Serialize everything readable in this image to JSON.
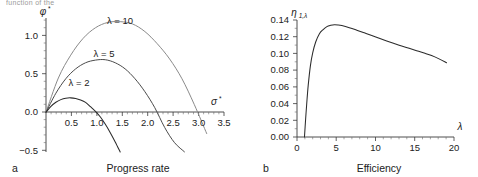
{
  "figure": {
    "top_cropped_text": "function of the",
    "panels": [
      {
        "letter": "a",
        "caption": "Progress rate"
      },
      {
        "letter": "b",
        "caption": "Efficiency"
      }
    ]
  },
  "chart_data": [
    {
      "type": "line",
      "panel": "a",
      "title": "Progress rate",
      "xlabel": "σ*",
      "ylabel": "φ*",
      "xlabel_base": "σ",
      "xlabel_sup": "*",
      "ylabel_base": "φ",
      "ylabel_sup": "*",
      "xlim": [
        0,
        3.6
      ],
      "ylim": [
        -0.55,
        1.3
      ],
      "grid": false,
      "legend": "inline-curve-labels",
      "xticks": [
        0.5,
        1.0,
        1.5,
        2.0,
        2.5,
        3.0,
        3.5
      ],
      "xtick_labels": [
        "0.5",
        "1.0",
        "1.5",
        "2.0",
        "2.5",
        "3.0",
        "3.5"
      ],
      "xticks_minor": [
        0.1,
        0.2,
        0.3,
        0.4,
        0.6,
        0.7,
        0.8,
        0.9,
        1.1,
        1.2,
        1.3,
        1.4,
        1.6,
        1.7,
        1.8,
        1.9,
        2.1,
        2.2,
        2.3,
        2.4,
        2.6,
        2.7,
        2.8,
        2.9,
        3.1,
        3.2,
        3.3,
        3.4
      ],
      "yticks": [
        -0.5,
        0.0,
        0.5,
        1.0
      ],
      "ytick_labels": [
        "−0.5",
        "0.0",
        "0.5",
        "1.0"
      ],
      "yticks_minor": [
        -0.4,
        -0.3,
        -0.2,
        -0.1,
        0.1,
        0.2,
        0.3,
        0.4,
        0.6,
        0.7,
        0.8,
        0.9,
        1.1,
        1.2
      ],
      "series": [
        {
          "name": "λ = 2",
          "label": "λ = 2",
          "color": "#2b2b2b",
          "peak_x": 0.55,
          "peak_y": 0.19,
          "zero_crossing_x": 1.1,
          "label_x": 0.72,
          "label_y": 0.34,
          "x": [
            0.0,
            0.1,
            0.2,
            0.3,
            0.4,
            0.5,
            0.6,
            0.7,
            0.8,
            0.9,
            1.0,
            1.1,
            1.2,
            1.3,
            1.4,
            1.5,
            1.6
          ],
          "values": [
            0.0,
            0.078,
            0.131,
            0.166,
            0.185,
            0.189,
            0.181,
            0.161,
            0.129,
            0.073,
            0.012,
            -0.062,
            -0.158,
            -0.268,
            -0.39,
            -0.522,
            -0.58
          ]
        },
        {
          "name": "λ = 5",
          "label": "λ = 5",
          "color": "#4a4a4a",
          "peak_x": 1.2,
          "peak_y": 0.69,
          "zero_crossing_x": 2.35,
          "label_x": 1.42,
          "label_y": 0.86,
          "x": [
            0.0,
            0.2,
            0.4,
            0.6,
            0.8,
            1.0,
            1.2,
            1.4,
            1.6,
            1.8,
            2.0,
            2.2,
            2.4,
            2.6,
            2.8,
            3.0
          ],
          "values": [
            0.0,
            0.25,
            0.44,
            0.57,
            0.65,
            0.685,
            0.69,
            0.65,
            0.57,
            0.44,
            0.27,
            0.06,
            -0.2,
            -0.4,
            -0.52,
            -0.58
          ]
        },
        {
          "name": "λ = 10",
          "label": "λ = 10",
          "color": "#8a8a8a",
          "peak_x": 1.55,
          "peak_y": 1.19,
          "zero_crossing_x": 3.1,
          "label_x": 1.62,
          "label_y": 1.38,
          "x": [
            0.0,
            0.25,
            0.5,
            0.75,
            1.0,
            1.25,
            1.5,
            1.75,
            2.0,
            2.25,
            2.5,
            2.75,
            3.0,
            3.25,
            3.5
          ],
          "values": [
            0.0,
            0.45,
            0.75,
            0.97,
            1.11,
            1.18,
            1.19,
            1.16,
            1.06,
            0.9,
            0.7,
            0.44,
            0.1,
            -0.28,
            -0.58
          ]
        }
      ]
    },
    {
      "type": "line",
      "panel": "b",
      "title": "Efficiency",
      "xlabel": "λ",
      "ylabel": "η₁,λ",
      "ylabel_base": "η",
      "ylabel_sub": "1,λ",
      "xlim": [
        0,
        21
      ],
      "ylim": [
        0.0,
        0.145
      ],
      "grid": false,
      "legend": "none",
      "xticks": [
        0,
        5,
        10,
        15,
        20
      ],
      "xtick_labels": [
        "0",
        "5",
        "10",
        "15",
        "20"
      ],
      "xticks_minor": [
        1,
        2,
        3,
        4,
        6,
        7,
        8,
        9,
        11,
        12,
        13,
        14,
        16,
        17,
        18,
        19
      ],
      "yticks": [
        0.0,
        0.02,
        0.04,
        0.06,
        0.08,
        0.1,
        0.12,
        0.14
      ],
      "ytick_labels": [
        "0.00",
        "0.02",
        "0.04",
        "0.06",
        "0.08",
        "0.10",
        "0.12",
        "0.14"
      ],
      "series": [
        {
          "name": "η₁,λ",
          "color": "#2b2b2b",
          "peak_x": 5.0,
          "peak_y": 0.135,
          "x": [
            1.0,
            1.15,
            1.3,
            1.5,
            1.8,
            2.1,
            2.5,
            3.0,
            3.5,
            4.0,
            4.5,
            5.0,
            5.5,
            6.0,
            7.0,
            8.0,
            9.0,
            10.0,
            11.0,
            12.0,
            13.0,
            14.0,
            15.0,
            16.0,
            17.0,
            18.0,
            19.0,
            20.0
          ],
          "values": [
            0.0,
            0.021,
            0.04,
            0.062,
            0.086,
            0.101,
            0.114,
            0.124,
            0.129,
            0.1325,
            0.134,
            0.1348,
            0.1345,
            0.1337,
            0.1312,
            0.1282,
            0.125,
            0.1218,
            0.1185,
            0.1153,
            0.1122,
            0.1092,
            0.1064,
            0.1036,
            0.1008,
            0.0978,
            0.0938,
            0.0892
          ]
        }
      ]
    }
  ]
}
